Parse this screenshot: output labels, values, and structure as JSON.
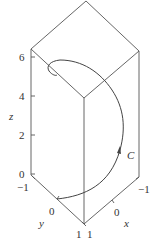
{
  "figure": {
    "type": "3d-space-curve",
    "curve_label": "C",
    "axes": {
      "x": {
        "label": "x",
        "ticks": [
          "1",
          "0",
          "-1"
        ]
      },
      "y": {
        "label": "y",
        "ticks": [
          "-1",
          "0",
          "1"
        ]
      },
      "z": {
        "label": "z",
        "ticks": [
          "0",
          "2",
          "4",
          "6"
        ]
      }
    }
  },
  "labels": {
    "z_axis": "z",
    "y_axis": "y",
    "x_axis": "x",
    "curve": "C",
    "z_tick_0": "0",
    "z_tick_2": "2",
    "z_tick_4": "4",
    "z_tick_6": "6",
    "y_tick_neg1": "−1",
    "y_tick_0": "0",
    "y_tick_1": "1",
    "x_tick_1": "1",
    "x_tick_0": "0",
    "x_tick_neg1": "−1"
  }
}
